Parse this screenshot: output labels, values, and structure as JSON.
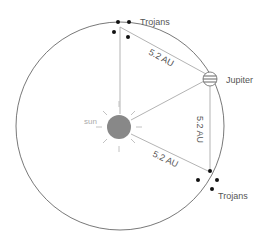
{
  "diagram": {
    "labels": {
      "sun": "sun",
      "jupiter": "Jupiter",
      "trojans_top": "Trojans",
      "trojans_bottom": "Trojans",
      "distance_top": "5.2 AU",
      "distance_right": "5.2 AU",
      "distance_bottom": "5.2 AU"
    },
    "colors": {
      "orbit": "#555555",
      "lines": "#aaaaaa",
      "sun": "#888888",
      "trojan_dots": "#111111"
    }
  }
}
